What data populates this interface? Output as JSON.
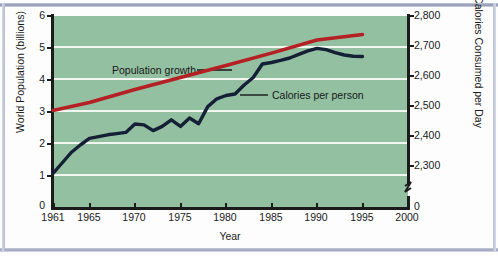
{
  "chart_data": {
    "type": "line",
    "title": "",
    "xlabel": "Year",
    "ylabel": "World Population (billions)",
    "y2label": "Calories Consumed per Day",
    "xlim": [
      1961,
      2000
    ],
    "ylim": [
      0,
      6
    ],
    "y2lim": [
      2250,
      2800
    ],
    "grid": true,
    "grid_color": "#f2f7f2",
    "plot_background": "#93c0a0",
    "legend_position": "inline-annotations",
    "x_ticks": [
      1961,
      1965,
      1970,
      1975,
      1980,
      1985,
      1990,
      1995,
      2000
    ],
    "x_tick_labels": [
      "1961",
      "1965",
      "1970",
      "1975",
      "1980",
      "1985",
      "1990",
      "1995",
      "2000"
    ],
    "y_ticks": [
      0,
      1,
      2,
      3,
      4,
      5,
      6
    ],
    "y_tick_labels": [
      "0",
      "1",
      "2",
      "3",
      "4",
      "5",
      "6"
    ],
    "y2_ticks": [
      2300,
      2400,
      2500,
      2600,
      2700,
      2800
    ],
    "y2_tick_labels": [
      "0",
      "2,300",
      "2,400",
      "2,500",
      "2,600",
      "2,700",
      "2,800"
    ],
    "y2_axis_break": true,
    "y2_break_note": "axis break between 0 and 2,300",
    "annotations": [
      {
        "text": "Population growth",
        "x": 1972,
        "y": 4.45,
        "leader_to_series": "Population growth"
      },
      {
        "text": "Calories per person",
        "x": 1983,
        "y": 3.9,
        "leader_to_series": "Calories per person"
      }
    ],
    "series": [
      {
        "name": "Population growth",
        "color": "#b52025",
        "axis": "left",
        "units": "billions",
        "x": [
          1961,
          1965,
          1970,
          1975,
          1980,
          1985,
          1990,
          1995
        ],
        "values": [
          3.05,
          3.3,
          3.7,
          4.08,
          4.45,
          4.84,
          5.25,
          5.42
        ]
      },
      {
        "name": "Calories per person",
        "color": "#152036",
        "axis": "right",
        "units": "calories per day",
        "x": [
          1961,
          1962,
          1963,
          1964,
          1965,
          1966,
          1967,
          1968,
          1969,
          1970,
          1971,
          1972,
          1973,
          1974,
          1975,
          1976,
          1977,
          1978,
          1979,
          1980,
          1981,
          1982,
          1983,
          1984,
          1985,
          1986,
          1987,
          1988,
          1989,
          1990,
          1991,
          1992,
          1993,
          1994,
          1995
        ],
        "values": [
          2275,
          2310,
          2345,
          2370,
          2392,
          2398,
          2404,
          2408,
          2412,
          2440,
          2437,
          2418,
          2432,
          2454,
          2432,
          2460,
          2441,
          2498,
          2524,
          2535,
          2540,
          2570,
          2595,
          2640,
          2645,
          2652,
          2660,
          2672,
          2684,
          2692,
          2688,
          2678,
          2670,
          2666,
          2665
        ]
      }
    ]
  },
  "axes": {
    "left_title": "World Population (billions)",
    "right_title": "Calories Consumed per Day",
    "x_title": "Year"
  },
  "labels": {
    "y_left": [
      "6",
      "5",
      "4",
      "3",
      "2",
      "1",
      "0"
    ],
    "y_right": [
      "2,800",
      "2,700",
      "2,600",
      "2,500",
      "2,400",
      "2,300",
      "0"
    ],
    "x": [
      "1961",
      "1965",
      "1970",
      "1975",
      "1980",
      "1985",
      "1990",
      "1995",
      "2000"
    ]
  },
  "annotations": {
    "population_growth": "Population growth",
    "calories_per_person": "Calories per person"
  },
  "colors": {
    "population_line": "#b52025",
    "calories_line": "#152036",
    "plot_bg": "#93c0a0",
    "gridline": "#f2f7f2",
    "axis": "#1b1b1b",
    "frame": "#9aa0ba"
  }
}
